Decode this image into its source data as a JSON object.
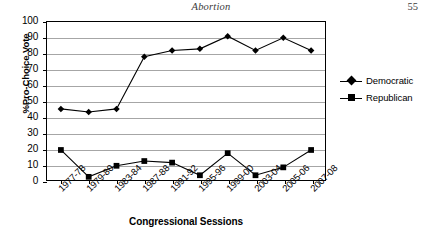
{
  "header": {
    "title": "Abortion",
    "page_number": "55"
  },
  "chart_data": {
    "type": "line",
    "title": "",
    "xlabel": "Congressional Sessions",
    "ylabel": "%Pro-Choice Vote",
    "ylim": [
      0,
      100
    ],
    "ytick_step": 10,
    "yticks": [
      "100",
      "90",
      "80",
      "70",
      "60",
      "50",
      "40",
      "30",
      "20",
      "10",
      "0"
    ],
    "grid": true,
    "legend_position": "right",
    "categories": [
      "1977-78",
      "1979-80",
      "1983-84",
      "1987-88",
      "1991-92",
      "1995-96",
      "1999-00",
      "2003-04",
      "2005-06",
      "2007-08"
    ],
    "series": [
      {
        "name": "Democratic",
        "marker": "diamond",
        "color": "#000000",
        "values": [
          45,
          43,
          45,
          78,
          82,
          83,
          91,
          82,
          90,
          82
        ]
      },
      {
        "name": "Republican",
        "marker": "square",
        "color": "#000000",
        "values": [
          19,
          2,
          9,
          12,
          11,
          3,
          17,
          3,
          8,
          19
        ]
      }
    ]
  }
}
